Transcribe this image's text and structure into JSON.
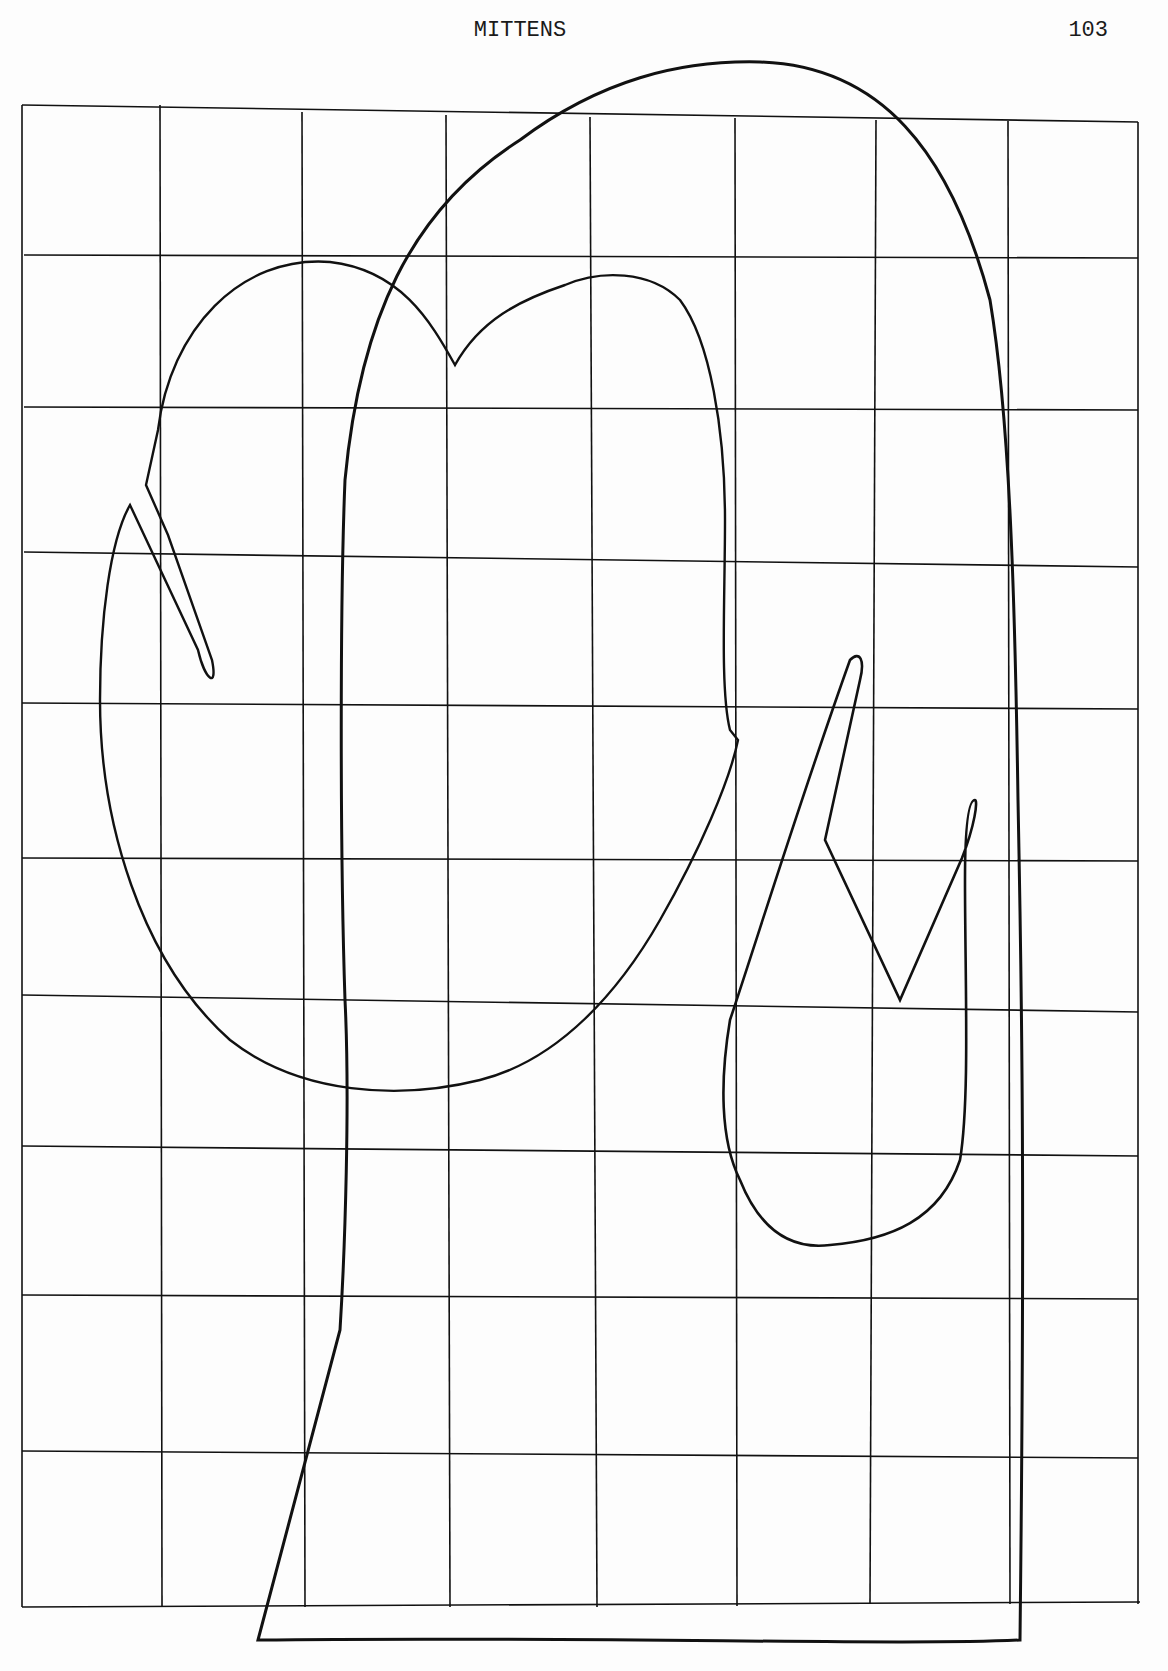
{
  "header": {
    "title": "MITTENS",
    "page_number": "103"
  },
  "diagram": {
    "type": "sewing pattern on grid",
    "grid": {
      "columns": 8,
      "rows": 10
    },
    "pieces": [
      {
        "name": "mitten-back",
        "description": "Large mitten outline with straight cuff at bottom"
      },
      {
        "name": "mitten-palm-with-thumb",
        "description": "Mitten palm piece with thumb on left and notched top"
      },
      {
        "name": "thumb-gusset",
        "description": "Separate thumb piece with V notch on right"
      }
    ],
    "colors": {
      "line": "#111111",
      "paper": "#fdfdfd"
    }
  }
}
